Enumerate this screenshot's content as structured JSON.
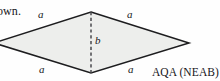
{
  "figure": {
    "shape_name": "rhombus",
    "fill_color": "#edeeec",
    "stroke_color": "#1d1d1f",
    "background_color": "#fefefe",
    "vertices": {
      "top": {
        "x": 91,
        "y": 12
      },
      "right": {
        "x": 189,
        "y": 43
      },
      "bottom": {
        "x": 91,
        "y": 73
      },
      "left": {
        "x": -6,
        "y": 43
      }
    },
    "diagonal": {
      "name": "vertical-diagonal",
      "style": "dashed",
      "from": {
        "x": 91,
        "y": 12
      },
      "to": {
        "x": 91,
        "y": 73
      },
      "label": "b"
    },
    "side_labels": {
      "top_left": "a",
      "top_right": "a",
      "bottom_left": "a",
      "bottom_right": "a"
    }
  },
  "text": {
    "cut_off_question_text": "own.",
    "attribution": "AQA (NEAB)"
  }
}
